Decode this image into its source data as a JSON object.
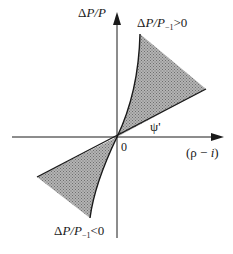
{
  "diagram": {
    "type": "phase-diagram",
    "axes": {
      "y_label_parts": [
        "Δ",
        "P",
        "/",
        "P"
      ],
      "x_label_parts": [
        "(ρ − ",
        "i",
        ")"
      ],
      "origin_label": "0"
    },
    "line_label": "ψ'",
    "regions": [
      {
        "id": "upper",
        "label_parts": [
          "Δ",
          "P",
          "/",
          "P",
          "−1",
          ">0"
        ],
        "fill": "#a8a8a8",
        "pattern": "stippled"
      },
      {
        "id": "lower",
        "label_parts": [
          "Δ",
          "P",
          "/",
          "P",
          "−1",
          "<0"
        ],
        "fill": "#a8a8a8",
        "pattern": "stippled"
      }
    ],
    "colors": {
      "ink": "#1a1a1a",
      "shade": "#a8a8a8",
      "background": "#ffffff"
    }
  }
}
